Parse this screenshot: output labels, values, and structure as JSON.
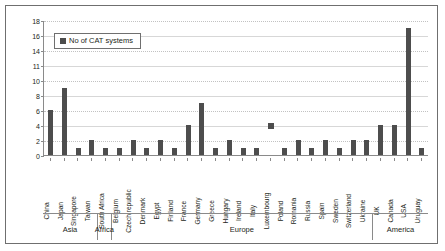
{
  "chart_data": {
    "type": "bar",
    "title": "",
    "xlabel": "",
    "ylabel": "",
    "ylim": [
      0,
      18
    ],
    "grid": true,
    "legend_position": "top-left",
    "legend": [
      "No of CAT systems"
    ],
    "ytick_labels": [
      "18",
      "16",
      "14",
      "11",
      "10",
      "8",
      "6",
      "4",
      "2",
      "0"
    ],
    "ytick_values": [
      18,
      16,
      14,
      12,
      10,
      8,
      6,
      4,
      2,
      0
    ],
    "categories": [
      "China",
      "Japan",
      "Singapore",
      "Taiwan",
      "South Africa",
      "Belgium",
      "Czech republic",
      "Denmark",
      "Egypt",
      "Finland",
      "France",
      "Germany",
      "Greece",
      "Hungary",
      "Ireland",
      "Italy",
      "Luxembourg",
      "Poland",
      "Romania",
      "Russia",
      "Spain",
      "Sweden",
      "Switzerland",
      "Ukraine",
      "UK",
      "Canada",
      "USA",
      "Uruguay"
    ],
    "values": [
      6,
      9,
      1,
      2,
      1,
      1,
      2,
      1,
      2,
      1,
      4,
      7,
      1,
      2,
      1,
      1,
      0,
      1,
      2,
      1,
      2,
      1,
      2,
      2,
      4,
      4,
      17,
      1
    ],
    "annotations": [
      {
        "label": "detached-marker",
        "category": "Luxembourg",
        "value": 4
      }
    ],
    "groups": [
      {
        "label": "Asia",
        "start": 0,
        "end": 3
      },
      {
        "label": "Africa",
        "start": 4,
        "end": 4
      },
      {
        "label": "Europe",
        "start": 5,
        "end": 23
      },
      {
        "label": "America",
        "start": 24,
        "end": 27
      }
    ],
    "series_color": "#4d4d4d"
  }
}
